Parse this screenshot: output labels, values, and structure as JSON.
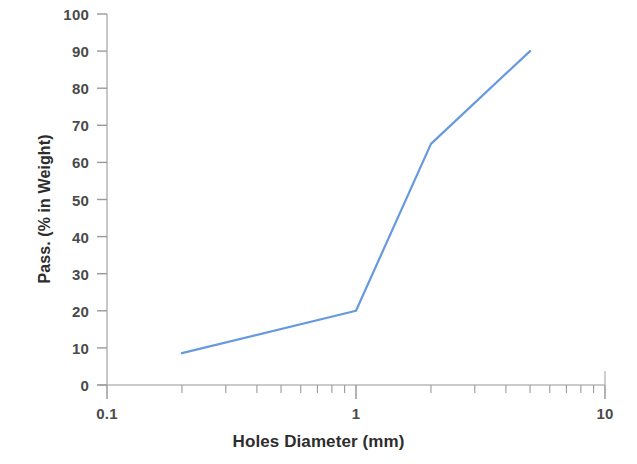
{
  "chart_data": {
    "type": "line",
    "title": "",
    "xlabel": "Holes Diameter (mm)",
    "ylabel": "Pass. (% in Weight)",
    "xscale": "log",
    "yscale": "linear",
    "xlim": [
      0.1,
      10
    ],
    "ylim": [
      0,
      100
    ],
    "grid": false,
    "legend": null,
    "x_tick_labels": [
      "0.1",
      "1",
      "10"
    ],
    "x_tick_values": [
      0.1,
      1,
      10
    ],
    "y_tick_labels": [
      "0",
      "10",
      "20",
      "30",
      "40",
      "50",
      "60",
      "70",
      "80",
      "90",
      "100"
    ],
    "y_tick_values": [
      0,
      10,
      20,
      30,
      40,
      50,
      60,
      70,
      80,
      90,
      100
    ],
    "series": [
      {
        "name": "Passing curve",
        "color": "#6699DD",
        "line_width": 2.2,
        "markers": false,
        "x": [
          0.2,
          1.0,
          2.0,
          5.0
        ],
        "values": [
          8.6,
          20.0,
          65.0,
          90.0
        ],
        "points": [
          {
            "x": 0.2,
            "y": 8.6
          },
          {
            "x": 1.0,
            "y": 20.0
          },
          {
            "x": 2.0,
            "y": 65.0
          },
          {
            "x": 5.0,
            "y": 90.0
          }
        ]
      }
    ],
    "axis_color": "#b9b9b9",
    "tick_color": "#9a9a9a",
    "background": "#ffffff"
  },
  "axes": {
    "x_title": "Holes Diameter (mm)",
    "y_title": "Pass. (% in Weight)"
  }
}
